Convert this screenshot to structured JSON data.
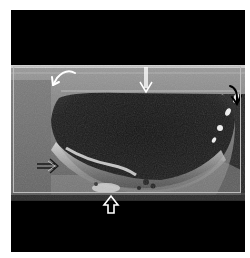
{
  "image": {
    "description": "Grayscale ultrasound image with a rectangular region-of-interest frame and five arrow annotations",
    "background": "#000000",
    "roi_frame_color": "#bdbdbd"
  },
  "annotations": [
    {
      "id": "curved-arrow-top-left",
      "style": "curved, white outline",
      "direction": "down-left"
    },
    {
      "id": "arrow-top-center",
      "style": "straight, white outline",
      "direction": "down"
    },
    {
      "id": "curved-arrow-top-right",
      "style": "curved, black",
      "direction": "down"
    },
    {
      "id": "arrow-left",
      "style": "straight, black outline",
      "direction": "right"
    },
    {
      "id": "open-arrow-bottom",
      "style": "open, white outline",
      "direction": "up"
    }
  ]
}
